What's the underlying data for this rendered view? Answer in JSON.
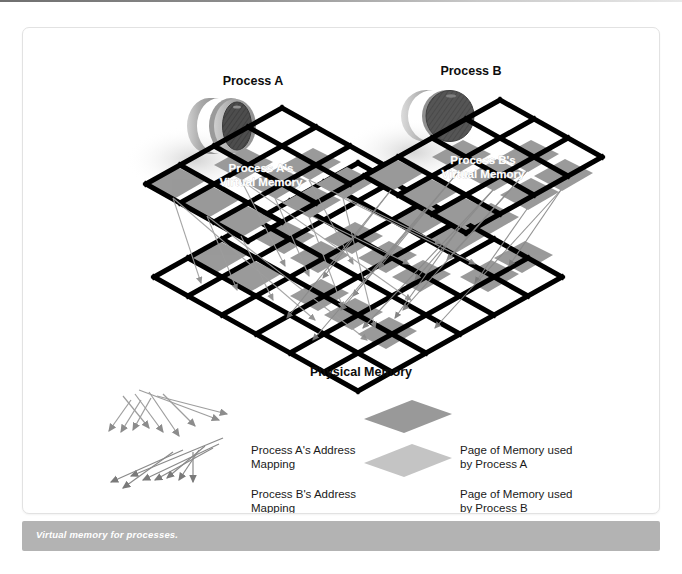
{
  "figure": {
    "caption": "Virtual memory for processes.",
    "process_a_title": "Process A",
    "process_b_title": "Process B",
    "virtual_memory_a_label": "Process A's\nVirtual Memory",
    "virtual_memory_b_label": "Process B's\nVirtual Memory",
    "physical_memory_label": "Physical Memory"
  },
  "legend": {
    "items": [
      {
        "label": "Process A's Address\nMapping",
        "kind": "arrows",
        "color": "#8c8c8c"
      },
      {
        "label": "Process B's Address\nMapping",
        "kind": "arrows",
        "color": "#7a7a7a"
      },
      {
        "label": "Page of Memory used\nby Process A",
        "kind": "swatch",
        "color": "#999999"
      },
      {
        "label": "Page of Memory used\nby Process B",
        "kind": "swatch",
        "color": "#c4c4c4"
      }
    ]
  },
  "colors": {
    "grid_line": "#000000",
    "page_a_fill": "#999999",
    "page_b_fill": "#c4c4c4",
    "caption_bar": "#b3b3b3",
    "caption_text": "#ffffff",
    "arrow_a": "#8c8c8c",
    "arrow_b": "#7a7a7a",
    "disc_a_face": "#4d4d4d",
    "disc_a_rim": "#b8b8b8",
    "disc_b_face": "#555555",
    "disc_b_rim": "#d0d0d0",
    "card_background": "#ffffff",
    "card_border": "#e2e2e2"
  },
  "diagram": {
    "type": "virtual-memory-mapping",
    "planes": [
      {
        "name": "process-a-virtual-memory",
        "rows": 3,
        "cols": 4
      },
      {
        "name": "process-b-virtual-memory",
        "rows": 3,
        "cols": 4
      },
      {
        "name": "physical-memory",
        "rows": 6,
        "cols": 7
      }
    ]
  }
}
